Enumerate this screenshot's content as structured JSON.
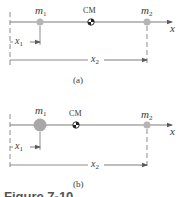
{
  "figure": {
    "caption_partial": "Figure 7-10",
    "colors": {
      "line": "#6e6e6e",
      "mass": "#b5b5b5",
      "text": "#3a3a3a"
    },
    "panels": [
      {
        "id": "a",
        "label": "(a)",
        "axis_label": "x",
        "cm_label": "CM",
        "mass1": {
          "symbol": "m",
          "subscript": "1",
          "relative_size": "small"
        },
        "mass2": {
          "symbol": "m",
          "subscript": "2",
          "relative_size": "small"
        },
        "distance1": {
          "symbol": "x",
          "subscript": "1"
        },
        "distance2": {
          "symbol": "x",
          "subscript": "2"
        }
      },
      {
        "id": "b",
        "label": "(b)",
        "axis_label": "x",
        "cm_label": "CM",
        "mass1": {
          "symbol": "m",
          "subscript": "1",
          "relative_size": "large"
        },
        "mass2": {
          "symbol": "m",
          "subscript": "2",
          "relative_size": "small"
        },
        "distance1": {
          "symbol": "x",
          "subscript": "1"
        },
        "distance2": {
          "symbol": "x",
          "subscript": "2"
        }
      }
    ]
  }
}
